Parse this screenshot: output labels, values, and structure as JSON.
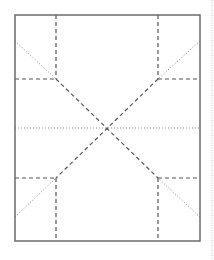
{
  "diagram": {
    "type": "fold-pattern",
    "colors": {
      "border": "#6b6b6b",
      "dashed": "#555555",
      "dotted": "#8a8a8a",
      "edge_guide": "#c8c8c8"
    },
    "border_rect": {
      "x": 15,
      "y": 15,
      "w": 185,
      "h": 226
    },
    "center": {
      "x": 107,
      "y": 128
    },
    "junctions": [
      {
        "x": 56,
        "y": 79
      },
      {
        "x": 158,
        "y": 79
      },
      {
        "x": 56,
        "y": 178
      },
      {
        "x": 158,
        "y": 178
      }
    ],
    "dashed_lines": [
      {
        "x1": 56,
        "y1": 15,
        "x2": 56,
        "y2": 79
      },
      {
        "x1": 158,
        "y1": 15,
        "x2": 158,
        "y2": 79
      },
      {
        "x1": 15,
        "y1": 79,
        "x2": 56,
        "y2": 79
      },
      {
        "x1": 158,
        "y1": 79,
        "x2": 200,
        "y2": 79
      },
      {
        "x1": 56,
        "y1": 178,
        "x2": 56,
        "y2": 241
      },
      {
        "x1": 158,
        "y1": 178,
        "x2": 158,
        "y2": 241
      },
      {
        "x1": 15,
        "y1": 178,
        "x2": 56,
        "y2": 178
      },
      {
        "x1": 158,
        "y1": 178,
        "x2": 200,
        "y2": 178
      },
      {
        "x1": 56,
        "y1": 79,
        "x2": 158,
        "y2": 178
      },
      {
        "x1": 158,
        "y1": 79,
        "x2": 56,
        "y2": 178
      }
    ],
    "dotted_lines": [
      {
        "x1": 15,
        "y1": 41,
        "x2": 56,
        "y2": 79
      },
      {
        "x1": 200,
        "y1": 41,
        "x2": 158,
        "y2": 79
      },
      {
        "x1": 15,
        "y1": 217,
        "x2": 56,
        "y2": 178
      },
      {
        "x1": 200,
        "y1": 217,
        "x2": 158,
        "y2": 178
      },
      {
        "x1": 15,
        "y1": 128,
        "x2": 200,
        "y2": 128
      }
    ],
    "edge_guide": {
      "x": 212,
      "y1": 0,
      "y2": 260
    }
  }
}
